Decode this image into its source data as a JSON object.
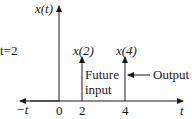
{
  "diagram": {
    "type": "signal-stem-plot",
    "side_label": "t=2",
    "y_axis_label": "x(t)",
    "x_axis": {
      "left_label": "−t",
      "right_label": "t",
      "ticks": [
        "0",
        "2",
        "4"
      ]
    },
    "stems": [
      {
        "t": 2,
        "label": "x(2)",
        "annotation_line1": "Future",
        "annotation_line2": "input"
      },
      {
        "t": 4,
        "label": "x(4)",
        "annotation": "Output"
      }
    ],
    "colors": {
      "ink": "#1a1a1a",
      "background": "#ffffff"
    }
  }
}
